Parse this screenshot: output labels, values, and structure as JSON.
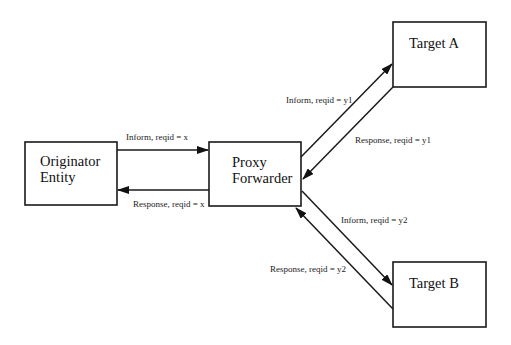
{
  "nodes": {
    "originator": {
      "line1": "Originator",
      "line2": "Entity"
    },
    "proxy": {
      "line1": "Proxy",
      "line2": "Forwarder"
    },
    "target_a": {
      "label": "Target A"
    },
    "target_b": {
      "label": "Target B"
    }
  },
  "edges": {
    "orig_to_proxy": "Inform, reqid = x",
    "proxy_to_orig": "Response, reqid = x",
    "proxy_to_a": "Inform, reqid = y1",
    "a_to_proxy": "Response, reqid = y1",
    "proxy_to_b": "Inform, reqid = y2",
    "b_to_proxy": "Response, reqid = y2"
  },
  "colors": {
    "stroke": "#1a1a1a",
    "background": "#ffffff"
  }
}
